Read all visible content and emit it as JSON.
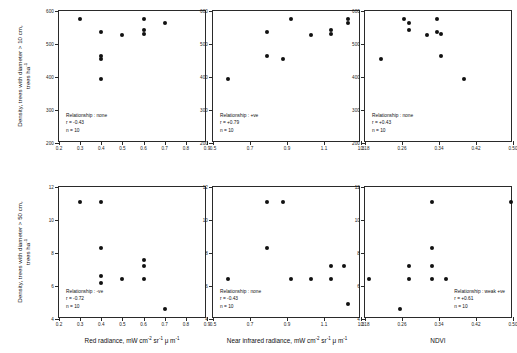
{
  "figure": {
    "rows": [
      {
        "id": "row-top",
        "ylabel_line1": "Density, trees with diameter > 10 cm,",
        "ylabel_line2": "trees ha",
        "ylabel_exp": "-1",
        "yticks": [
          "600",
          "500",
          "400",
          "300",
          "200"
        ],
        "ylim": [
          200,
          600
        ]
      },
      {
        "id": "row-bottom",
        "ylabel_line1": "Density, trees with diameter > 50 cm,",
        "ylabel_line2": "trees ha",
        "ylabel_exp": "-1",
        "yticks": [
          "12",
          "10",
          "8",
          "6",
          "4"
        ],
        "ylim": [
          4,
          12
        ]
      }
    ],
    "xaxes": [
      {
        "label_text": "Red radiance, mW cm",
        "label_sup1": "-2",
        "label_mid": " sr",
        "label_sup2": "-1",
        "label_mu": " μ m",
        "label_sup3": "-1",
        "ticks": [
          "0.2",
          "0.3",
          "0.4",
          "0.5",
          "0.6",
          "0.7",
          "0.8",
          "0.9"
        ],
        "xlim": [
          0.2,
          0.9
        ]
      },
      {
        "label_text": "Near infrared radiance, mW cm",
        "label_sup1": "-2",
        "label_mid": " sr",
        "label_sup2": "-1",
        "label_mu": " μ m",
        "label_sup3": "-1",
        "ticks": [
          "0.5",
          "0.7",
          "0.9",
          "1.1",
          "1.3"
        ],
        "xlim": [
          0.5,
          1.3
        ]
      },
      {
        "label_text": "NDVI",
        "label_sup1": "",
        "label_mid": "",
        "label_sup2": "",
        "label_mu": "",
        "label_sup3": "",
        "ticks": [
          "0.18",
          "0.26",
          "0.34",
          "0.42",
          "0.50"
        ],
        "xlim": [
          0.18,
          0.5
        ]
      }
    ]
  },
  "chart_data": [
    {
      "type": "scatter",
      "panel": "top-left",
      "title": "",
      "xlabel": "Red radiance, mW cm-2 sr-1 um-1",
      "ylabel": "Density, trees with diameter > 10 cm, trees ha-1",
      "xlim": [
        0.2,
        0.9
      ],
      "ylim": [
        200,
        600
      ],
      "grid": false,
      "n": 10,
      "annotation": {
        "relationship": "Relationship : none",
        "r": "r = -0.43",
        "n": "n = 10"
      },
      "points": [
        {
          "x": 0.3,
          "y": 575
        },
        {
          "x": 0.4,
          "y": 537
        },
        {
          "x": 0.4,
          "y": 463
        },
        {
          "x": 0.4,
          "y": 455
        },
        {
          "x": 0.4,
          "y": 393
        },
        {
          "x": 0.5,
          "y": 528
        },
        {
          "x": 0.6,
          "y": 575
        },
        {
          "x": 0.6,
          "y": 543
        },
        {
          "x": 0.6,
          "y": 530
        },
        {
          "x": 0.7,
          "y": 565
        }
      ]
    },
    {
      "type": "scatter",
      "panel": "top-middle",
      "title": "",
      "xlabel": "Near infrared radiance, mW cm-2 sr-1 um-1",
      "ylabel": "Density, trees with diameter > 10 cm, trees ha-1",
      "xlim": [
        0.5,
        1.3
      ],
      "ylim": [
        200,
        600
      ],
      "grid": false,
      "n": 10,
      "annotation": {
        "relationship": "Relationship : +ve",
        "r": "r = +0.79",
        "n": "n = 10"
      },
      "points": [
        {
          "x": 0.58,
          "y": 393
        },
        {
          "x": 0.79,
          "y": 537
        },
        {
          "x": 0.79,
          "y": 463
        },
        {
          "x": 0.88,
          "y": 455
        },
        {
          "x": 0.92,
          "y": 575
        },
        {
          "x": 1.03,
          "y": 528
        },
        {
          "x": 1.14,
          "y": 543
        },
        {
          "x": 1.14,
          "y": 530
        },
        {
          "x": 1.23,
          "y": 575
        },
        {
          "x": 1.23,
          "y": 565
        }
      ]
    },
    {
      "type": "scatter",
      "panel": "top-right",
      "title": "",
      "xlabel": "NDVI",
      "ylabel": "Density, trees with diameter > 10 cm, trees ha-1",
      "xlim": [
        0.18,
        0.5
      ],
      "ylim": [
        200,
        600
      ],
      "grid": false,
      "n": 10,
      "annotation": {
        "relationship": "Relationship : none",
        "r": "r = +0.43",
        "n": "n = 10"
      },
      "points": [
        {
          "x": 0.215,
          "y": 455
        },
        {
          "x": 0.265,
          "y": 575
        },
        {
          "x": 0.275,
          "y": 565
        },
        {
          "x": 0.275,
          "y": 543
        },
        {
          "x": 0.315,
          "y": 528
        },
        {
          "x": 0.335,
          "y": 575
        },
        {
          "x": 0.335,
          "y": 537
        },
        {
          "x": 0.345,
          "y": 530
        },
        {
          "x": 0.345,
          "y": 463
        },
        {
          "x": 0.395,
          "y": 393
        }
      ]
    },
    {
      "type": "scatter",
      "panel": "bottom-left",
      "title": "",
      "xlabel": "Red radiance, mW cm-2 sr-1 um-1",
      "ylabel": "Density, trees with diameter > 50 cm, trees ha-1",
      "xlim": [
        0.2,
        0.9
      ],
      "ylim": [
        4,
        12
      ],
      "grid": false,
      "n": 10,
      "annotation": {
        "relationship": "Relationship : -ve",
        "r": "r = -0.72",
        "n": "n = 10"
      },
      "points": [
        {
          "x": 0.3,
          "y": 11.1
        },
        {
          "x": 0.4,
          "y": 11.1
        },
        {
          "x": 0.4,
          "y": 8.3
        },
        {
          "x": 0.4,
          "y": 6.6
        },
        {
          "x": 0.4,
          "y": 6.2
        },
        {
          "x": 0.5,
          "y": 6.4
        },
        {
          "x": 0.6,
          "y": 7.6
        },
        {
          "x": 0.6,
          "y": 7.2
        },
        {
          "x": 0.6,
          "y": 6.4
        },
        {
          "x": 0.7,
          "y": 4.6
        }
      ]
    },
    {
      "type": "scatter",
      "panel": "bottom-middle",
      "title": "",
      "xlabel": "Near infrared radiance, mW cm-2 sr-1 um-1",
      "ylabel": "Density, trees with diameter > 50 cm, trees ha-1",
      "xlim": [
        0.5,
        1.3
      ],
      "ylim": [
        4,
        12
      ],
      "grid": false,
      "n": 10,
      "annotation": {
        "relationship": "Relationship : none",
        "r": "r = -0.43",
        "n": "n = 10"
      },
      "points": [
        {
          "x": 0.58,
          "y": 6.4
        },
        {
          "x": 0.79,
          "y": 11.1
        },
        {
          "x": 0.79,
          "y": 8.3
        },
        {
          "x": 0.88,
          "y": 11.1
        },
        {
          "x": 0.92,
          "y": 6.4
        },
        {
          "x": 1.03,
          "y": 6.4
        },
        {
          "x": 1.14,
          "y": 7.2
        },
        {
          "x": 1.14,
          "y": 6.4
        },
        {
          "x": 1.21,
          "y": 7.2
        },
        {
          "x": 1.23,
          "y": 4.9
        }
      ]
    },
    {
      "type": "scatter",
      "panel": "bottom-right",
      "title": "",
      "xlabel": "NDVI",
      "ylabel": "Density, trees with diameter > 50 cm, trees ha-1",
      "xlim": [
        0.18,
        0.5
      ],
      "ylim": [
        4,
        12
      ],
      "grid": false,
      "n": 10,
      "annotation": {
        "relationship": "Relationship : weak +ve",
        "r": "r = +0.61",
        "n": "n = 10"
      },
      "points": [
        {
          "x": 0.188,
          "y": 6.4
        },
        {
          "x": 0.255,
          "y": 4.6
        },
        {
          "x": 0.275,
          "y": 7.2
        },
        {
          "x": 0.275,
          "y": 6.4
        },
        {
          "x": 0.325,
          "y": 11.1
        },
        {
          "x": 0.325,
          "y": 8.3
        },
        {
          "x": 0.325,
          "y": 7.2
        },
        {
          "x": 0.325,
          "y": 6.4
        },
        {
          "x": 0.355,
          "y": 6.4
        },
        {
          "x": 0.495,
          "y": 11.1
        }
      ]
    }
  ]
}
